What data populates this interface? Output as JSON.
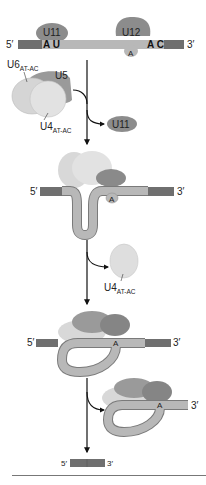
{
  "diagram": {
    "colors": {
      "exon": "#6f6f6f",
      "intron": "#b8b8b8",
      "snrnp_dark": "#8a8a8a",
      "snrnp_light": "#dcdcdc",
      "arrow": "#111111"
    },
    "stage1": {
      "five_prime": "5′",
      "three_prime": "3′",
      "u11": "U11",
      "u12": "U12",
      "au": "A U",
      "ac": "A C",
      "branch_a": "A"
    },
    "tri_snrnp": {
      "u6": "U6",
      "u6_sub": "AT-AC",
      "u5": "U5",
      "u4": "U4",
      "u4_sub": "AT-AC"
    },
    "released_u11": "U11",
    "stage2": {
      "five_prime": "5′",
      "three_prime": "3′",
      "branch_a": "A"
    },
    "released_u4": {
      "label": "U4",
      "sub": "AT-AC"
    },
    "stage3": {
      "five_prime": "5′",
      "three_prime": "3′",
      "branch_a": "A"
    },
    "stage4": {
      "three_prime": "3′",
      "branch_a": "A"
    },
    "product": {
      "five_prime": "5′",
      "three_prime": "3′"
    }
  }
}
